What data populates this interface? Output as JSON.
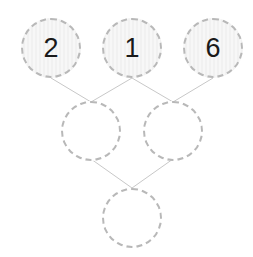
{
  "puzzle": {
    "rows": [
      [
        {
          "value": "2"
        },
        {
          "value": "1"
        },
        {
          "value": "6"
        }
      ],
      [
        {
          "value": ""
        },
        {
          "value": ""
        }
      ],
      [
        {
          "value": ""
        }
      ]
    ]
  },
  "colors": {
    "node_border": "#b8b8b8",
    "edge": "#c8c8c8",
    "text": "#1a1a1a",
    "filled_bg": "#f3f3f3"
  }
}
